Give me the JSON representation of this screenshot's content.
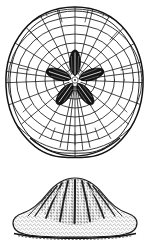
{
  "plate": {
    "title": "Echinoid test — aboral and lateral views",
    "background_color": "#ffffff",
    "ink_color": "#1a1a1a",
    "stipple_color": "#3a3a3a",
    "petal_fill_color": "#141414",
    "width_px": 149,
    "height_px": 243
  },
  "figures": [
    {
      "id": "aboral-view",
      "label": "aboral view",
      "description": "Rounded sub-triangular test outline with plate mosaic of concentric growth arcs crossed by radial sutures, and a dark five-rayed petaloid ambulacral rosette at the apical centre.",
      "center_x": 75,
      "center_y": 80,
      "outline_shape": "rounded-triangle",
      "mosaic": {
        "concentric_rings": 9,
        "radial_sutures": 26,
        "plate_count_approx": 230
      },
      "rosette": {
        "petal_count": 5,
        "petal_length_px": 26,
        "petal_width_px": 11,
        "fill": "#141414",
        "start_angle_deg": -90
      }
    },
    {
      "id": "lateral-view",
      "label": "lateral view",
      "description": "Low trigonal dome with flattened, slightly undulate base; surface finely stippled; dark narrow grooves radiate down from the apex.",
      "center_x": 75,
      "apex_y": 180,
      "base_y": 236,
      "left_x": 12,
      "right_x": 138,
      "groove_count": 9,
      "stipple_density": "fine"
    }
  ]
}
